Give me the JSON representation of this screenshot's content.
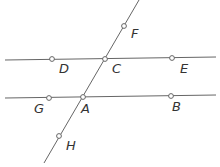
{
  "diagram": {
    "colors": {
      "line": "#666666",
      "point_fill": "#ffffff",
      "label": "#333333"
    },
    "lines": [
      {
        "name": "line-DE",
        "x1": 5,
        "y1": 60,
        "x2": 216,
        "y2": 57
      },
      {
        "name": "line-GB",
        "x1": 5,
        "y1": 98,
        "x2": 216,
        "y2": 95
      },
      {
        "name": "transversal-FH",
        "x1": 44,
        "y1": 163,
        "x2": 139,
        "y2": 0
      }
    ],
    "points": [
      {
        "label": "F",
        "x": 124,
        "y": 26,
        "lx": 131,
        "ly": 38
      },
      {
        "label": "D",
        "x": 52,
        "y": 59,
        "lx": 59,
        "ly": 73
      },
      {
        "label": "C",
        "x": 105,
        "y": 59,
        "lx": 112,
        "ly": 73
      },
      {
        "label": "E",
        "x": 172,
        "y": 58,
        "lx": 180,
        "ly": 73
      },
      {
        "label": "G",
        "x": 49,
        "y": 98,
        "lx": 34,
        "ly": 113
      },
      {
        "label": "A",
        "x": 83,
        "y": 97,
        "lx": 81,
        "ly": 113
      },
      {
        "label": "B",
        "x": 171,
        "y": 96,
        "lx": 172,
        "ly": 111
      },
      {
        "label": "H",
        "x": 59,
        "y": 136,
        "lx": 66,
        "ly": 150
      }
    ]
  }
}
